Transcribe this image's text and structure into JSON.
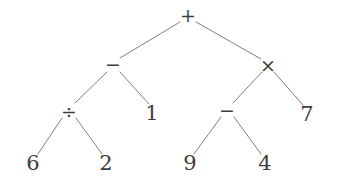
{
  "diagram": {
    "type": "binary-expression-tree",
    "expression": "((6 ÷ 2) − 1) + ((9 − 4) × 7)",
    "background_color": "#ffffff",
    "edge_color": "#808080",
    "node_color": "#3d3d3d",
    "edge_width": 1,
    "width": 339,
    "height": 194
  },
  "nodes": [
    {
      "id": "n0",
      "label": "+",
      "kind": "operator",
      "icon": "plus-operator-icon",
      "x": 188,
      "y": 15,
      "depth": 0
    },
    {
      "id": "n1",
      "label": "−",
      "kind": "operator",
      "icon": "minus-operator-icon",
      "x": 113,
      "y": 64,
      "depth": 1
    },
    {
      "id": "n2",
      "label": "×",
      "kind": "operator",
      "icon": "times-operator-icon",
      "x": 268,
      "y": 65,
      "depth": 1
    },
    {
      "id": "n3",
      "label": "÷",
      "kind": "operator",
      "icon": "divide-operator-icon",
      "x": 69,
      "y": 111,
      "depth": 2
    },
    {
      "id": "n4",
      "label": "1",
      "kind": "operand",
      "icon": "digit-one-icon",
      "x": 152,
      "y": 113,
      "depth": 2
    },
    {
      "id": "n5",
      "label": "−",
      "kind": "operator",
      "icon": "minus-operator-icon",
      "x": 227,
      "y": 110,
      "depth": 2
    },
    {
      "id": "n6",
      "label": "7",
      "kind": "operand",
      "icon": "digit-seven-icon",
      "x": 307,
      "y": 114,
      "depth": 2
    },
    {
      "id": "n7",
      "label": "6",
      "kind": "operand",
      "icon": "digit-six-icon",
      "x": 33,
      "y": 163,
      "depth": 3
    },
    {
      "id": "n8",
      "label": "2",
      "kind": "operand",
      "icon": "digit-two-icon",
      "x": 106,
      "y": 163,
      "depth": 3
    },
    {
      "id": "n9",
      "label": "9",
      "kind": "operand",
      "icon": "digit-nine-icon",
      "x": 190,
      "y": 163,
      "depth": 3
    },
    {
      "id": "n10",
      "label": "4",
      "kind": "operand",
      "icon": "digit-four-icon",
      "x": 265,
      "y": 163,
      "depth": 3
    }
  ],
  "edges": [
    {
      "from": "n0",
      "to": "n1",
      "x1": 180,
      "y1": 22,
      "x2": 120,
      "y2": 58
    },
    {
      "from": "n0",
      "to": "n2",
      "x1": 196,
      "y1": 22,
      "x2": 261,
      "y2": 59
    },
    {
      "from": "n1",
      "to": "n3",
      "x1": 107,
      "y1": 72,
      "x2": 75,
      "y2": 103
    },
    {
      "from": "n1",
      "to": "n4",
      "x1": 120,
      "y1": 72,
      "x2": 149,
      "y2": 104
    },
    {
      "from": "n2",
      "to": "n5",
      "x1": 262,
      "y1": 72,
      "x2": 233,
      "y2": 103
    },
    {
      "from": "n2",
      "to": "n6",
      "x1": 274,
      "y1": 72,
      "x2": 303,
      "y2": 105
    },
    {
      "from": "n3",
      "to": "n7",
      "x1": 62,
      "y1": 118,
      "x2": 38,
      "y2": 154
    },
    {
      "from": "n3",
      "to": "n8",
      "x1": 76,
      "y1": 118,
      "x2": 102,
      "y2": 154
    },
    {
      "from": "n5",
      "to": "n9",
      "x1": 221,
      "y1": 117,
      "x2": 194,
      "y2": 154
    },
    {
      "from": "n5",
      "to": "n10",
      "x1": 234,
      "y1": 117,
      "x2": 261,
      "y2": 154
    }
  ]
}
